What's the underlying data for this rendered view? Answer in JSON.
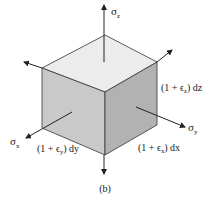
{
  "figure": {
    "caption": "(b)",
    "colors": {
      "top_face": "#ececec",
      "left_face": "#c9c9c9",
      "right_face": "#b2b2b2",
      "edge": "#333333",
      "arrow": "#222222"
    }
  },
  "labels": {
    "sigma_z": "σ",
    "sigma_z_sub": "z",
    "sigma_x": "σ",
    "sigma_x_sub": "x",
    "sigma_y": "σ",
    "sigma_y_sub": "y",
    "dim_z": "(1 + ϵz) dz",
    "dim_z_prefix": "(1 + ϵ",
    "dim_z_sub": "z",
    "dim_z_suffix": ") dz",
    "dim_y_prefix": "(1 + ϵ",
    "dim_y_sub": "y",
    "dim_y_suffix": ") dy",
    "dim_x_prefix": "(1 + ϵ",
    "dim_x_sub": "x",
    "dim_x_suffix": ") dx"
  }
}
